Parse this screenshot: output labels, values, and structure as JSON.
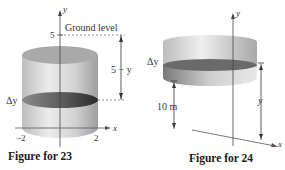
{
  "figures": [
    {
      "id": "fig23",
      "caption": "Figure for 23",
      "labels": {
        "y_axis": "y",
        "x_axis": "x",
        "tick_top": "5",
        "ground": "Ground level",
        "distance": "5 − y",
        "slice": "Δy",
        "x_left": "−2",
        "x_right": "2"
      },
      "colors": {
        "cylinder": "#c8c8c8",
        "slice": "#5e5e5e"
      }
    },
    {
      "id": "fig24",
      "caption": "Figure for 24",
      "labels": {
        "y_axis": "y",
        "x_axis": "x",
        "slice": "Δy",
        "height": "10 m",
        "distance": "y"
      },
      "colors": {
        "cylinder": "#d0d0d0",
        "slice": "#666666"
      }
    }
  ]
}
